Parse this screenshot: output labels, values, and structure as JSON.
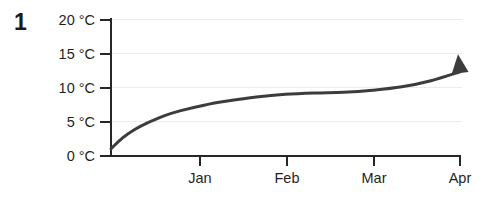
{
  "figure": {
    "number_label": "1"
  },
  "chart_data": {
    "type": "line",
    "title": "",
    "subtitle": "",
    "xlabel": "",
    "ylabel": "",
    "grid": true,
    "legend": null,
    "legend_position": "none",
    "series_color": "#3c3c3c",
    "gridline_color": "#ececec",
    "axis_color": "#262626",
    "arrow_end": true,
    "arrow_end_label": "arrow-head-up-right",
    "ylim": [
      0,
      20
    ],
    "yticks": [
      0,
      5,
      10,
      15,
      20
    ],
    "ytick_labels": [
      "0 °C",
      "5 °C",
      "10 °C",
      "15 °C",
      "20 °C"
    ],
    "y_unit": "°C",
    "xtick_labels": [
      "Jan",
      "Feb",
      "Mar",
      "Apr"
    ],
    "x": [
      0.0,
      0.1,
      0.2,
      0.3,
      0.45,
      0.6,
      0.8,
      1.0,
      1.25,
      1.5,
      1.75,
      2.0,
      2.25,
      2.5,
      2.75,
      3.0
    ],
    "series": [
      {
        "name": "Temperature",
        "values": [
          1.0,
          2.6,
          3.8,
          4.7,
          5.8,
          6.6,
          7.4,
          8.0,
          8.6,
          9.0,
          9.2,
          9.3,
          9.6,
          10.1,
          11.0,
          12.3
        ]
      }
    ],
    "endpoint_value": 14.9,
    "start_value": 1.0
  }
}
